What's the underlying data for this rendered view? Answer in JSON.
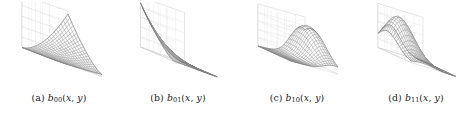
{
  "figure": {
    "name": "bilinear-basis-function-surface-grid",
    "background_color": "#ffffff",
    "mesh_color": "#8a8a8a",
    "axis_color": "#cfcfcf",
    "caption_color": "#222222",
    "panel_count": 4,
    "panels": [
      {
        "id": "a",
        "tag": "(a)",
        "symbol": "b",
        "subscript": "00",
        "args_open": "(",
        "arg_x": "x",
        "comma": ", ",
        "arg_y": "y",
        "args_close": ")",
        "caption": "(a) b00(x, y)",
        "surface_description": "monotonically rising saddle-free sheet, high at far corner"
      },
      {
        "id": "b",
        "tag": "(b)",
        "symbol": "b",
        "subscript": "01",
        "args_open": "(",
        "arg_x": "x",
        "comma": ", ",
        "arg_y": "y",
        "args_close": ")",
        "caption": "(b) b01(x, y)",
        "surface_description": "ridge rising toward back-left wall, flat toward front-right"
      },
      {
        "id": "c",
        "tag": "(c)",
        "symbol": "b",
        "subscript": "10",
        "args_open": "(",
        "arg_x": "x",
        "comma": ", ",
        "arg_y": "y",
        "args_close": ")",
        "caption": "(c) b10(x, y)",
        "surface_description": "low flat plateau in front with a wave crest rising at the right"
      },
      {
        "id": "d",
        "tag": "(d)",
        "symbol": "b",
        "subscript": "11",
        "args_open": "(",
        "arg_x": "x",
        "comma": ", ",
        "arg_y": "y",
        "args_close": ")",
        "caption": "(d) b11(x, y)",
        "surface_description": "single broad hump peaking at the back-left, falling to flat base"
      }
    ]
  },
  "chart_data": [
    {
      "type": "surface",
      "id": "a",
      "title": "(a) b00(x, y)",
      "xlabel": "x",
      "ylabel": "y",
      "zlabel": "b00",
      "xlim": [
        0,
        1
      ],
      "ylim": [
        0,
        1
      ],
      "zlim": [
        0,
        1
      ],
      "grid": true,
      "legend": "none",
      "formula": "b00(x,y) = (1-x)(1-y) style bilinear basis, rendered as rising sheet",
      "nx": 20,
      "ny": 20,
      "z_corner_values": {
        "x0y0": 0.0,
        "x1y0": 0.0,
        "x0y1": 0.25,
        "x1y1": 1.0
      },
      "peak_value": 1.0,
      "peak_location": [
        1,
        1
      ]
    },
    {
      "type": "surface",
      "id": "b",
      "title": "(b) b01(x, y)",
      "xlabel": "x",
      "ylabel": "y",
      "zlabel": "b01",
      "xlim": [
        0,
        1
      ],
      "ylim": [
        0,
        1
      ],
      "zlim": [
        0,
        1
      ],
      "grid": true,
      "legend": "none",
      "formula": "b01(x,y) ridge along back edge decaying to the front",
      "nx": 20,
      "ny": 20,
      "z_corner_values": {
        "x0y0": 0.0,
        "x1y0": 0.0,
        "x0y1": 1.0,
        "x1y1": 0.1
      },
      "peak_value": 1.0,
      "peak_location": [
        0,
        1
      ]
    },
    {
      "type": "surface",
      "id": "c",
      "title": "(c) b10(x, y)",
      "xlabel": "x",
      "ylabel": "y",
      "zlabel": "b10",
      "xlim": [
        0,
        1
      ],
      "ylim": [
        0,
        1
      ],
      "zlim": [
        0,
        1
      ],
      "grid": true,
      "legend": "none",
      "formula": "b10(x,y) flat low plateau with a crest rising on the right side",
      "nx": 20,
      "ny": 20,
      "z_corner_values": {
        "x0y0": 0.0,
        "x1y0": 0.0,
        "x0y1": 0.0,
        "x1y1": 0.85
      },
      "peak_value": 0.85,
      "peak_location": [
        1,
        0.8
      ]
    },
    {
      "type": "surface",
      "id": "d",
      "title": "(d) b11(x, y)",
      "xlabel": "x",
      "ylabel": "y",
      "zlabel": "b11",
      "xlim": [
        0,
        1
      ],
      "ylim": [
        0,
        1
      ],
      "zlim": [
        0,
        1
      ],
      "grid": true,
      "legend": "none",
      "formula": "b11(x,y) single interior hump peaking near the back-left",
      "nx": 20,
      "ny": 20,
      "z_corner_values": {
        "x0y0": 0.0,
        "x1y0": 0.0,
        "x0y1": 0.0,
        "x1y1": 0.0
      },
      "peak_value": 0.9,
      "peak_location": [
        0.25,
        0.75
      ]
    }
  ]
}
